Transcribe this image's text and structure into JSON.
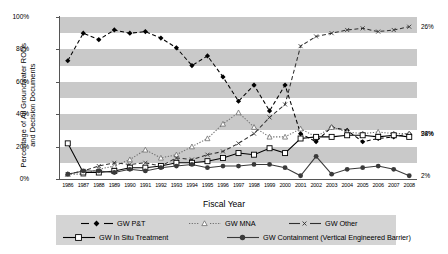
{
  "chart_data": {
    "type": "line",
    "title": "",
    "xlabel": "Fiscal Year",
    "ylabel": "Percentage of All Groundwater RODs and Decision Documents",
    "ylabel_lines": [
      "Percentage of All Groundwater RODs",
      "and Decision Documents"
    ],
    "ylim": [
      0,
      100
    ],
    "yticks": [
      "0%",
      "20%",
      "40%",
      "60%",
      "80%",
      "100%"
    ],
    "ytick_values": [
      0,
      20,
      40,
      60,
      80,
      100
    ],
    "grid": "horizontal-banding",
    "legend_position": "bottom",
    "categories": [
      "1986",
      "1987",
      "1988",
      "1989",
      "1990",
      "1991",
      "1992",
      "1993",
      "1994",
      "1995",
      "1996",
      "1997",
      "1998",
      "1999",
      "2000",
      "2001",
      "2002",
      "2003",
      "2004",
      "2005",
      "2006",
      "2007",
      "2008"
    ],
    "series": [
      {
        "name": "GW P&T",
        "marker": "filled-diamond",
        "line": "dashed",
        "color": "#000000",
        "end_label": "28%",
        "values": [
          73,
          90,
          86,
          92,
          90,
          91,
          87,
          81,
          70,
          76,
          63,
          48,
          58,
          42,
          58,
          28,
          23,
          32,
          30,
          23,
          25,
          26,
          28
        ]
      },
      {
        "name": "GW MNA",
        "marker": "open-triangle",
        "line": "dotted",
        "color": "#6e6e6e",
        "end_label": "94%",
        "values": [
          3,
          3,
          6,
          8,
          12,
          18,
          13,
          15,
          20,
          25,
          34,
          41,
          32,
          26,
          26,
          31,
          26,
          32,
          29,
          28,
          29,
          28,
          28
        ]
      },
      {
        "name": "GW Other",
        "marker": "small-x",
        "line": "dashed",
        "color": "#303030",
        "end_label": "26%",
        "values": [
          3,
          5,
          8,
          10,
          9,
          10,
          8,
          13,
          12,
          15,
          17,
          22,
          28,
          38,
          46,
          82,
          88,
          90,
          92,
          93,
          91,
          92,
          94
        ]
      },
      {
        "name": "GW In Situ Treatment",
        "marker": "open-square",
        "line": "solid",
        "color": "#000000",
        "end_label": "",
        "values": [
          22,
          4,
          4,
          5,
          7,
          7,
          8,
          10,
          10,
          11,
          13,
          16,
          15,
          19,
          16,
          25,
          26,
          26,
          27,
          27,
          26,
          27,
          26
        ]
      },
      {
        "name": "GW Containment (Vertical Engineered Barrier)",
        "marker": "filled-circle",
        "line": "solid",
        "color": "#3a3a3a",
        "end_label": "2%",
        "values": [
          3,
          5,
          5,
          4,
          6,
          5,
          7,
          8,
          9,
          7,
          8,
          8,
          9,
          9,
          7,
          2,
          14,
          3,
          6,
          7,
          8,
          6,
          2
        ]
      }
    ]
  },
  "legend": {
    "items": [
      {
        "label": "GW P&T"
      },
      {
        "label": "GW MNA"
      },
      {
        "label": "GW Other"
      },
      {
        "label": "GW In Situ Treatment"
      },
      {
        "label": "GW Containment (Vertical Engineered Barrier)"
      }
    ]
  }
}
